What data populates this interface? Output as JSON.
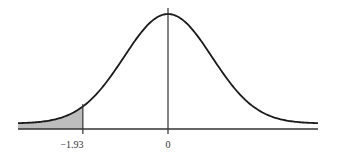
{
  "chart_data": {
    "type": "area",
    "title": "",
    "xlabel": "",
    "ylabel": "",
    "distribution": "standard normal",
    "mean": 0,
    "sd": 1,
    "xlim": [
      -3.4,
      3.4
    ],
    "tick_labels": [
      "-1.93",
      "0"
    ],
    "ticks": [
      -1.93,
      0
    ],
    "shaded_region": {
      "from": -3.4,
      "to": -1.93,
      "tail": "left"
    },
    "grid": false,
    "legend": "none",
    "colors": {
      "curve": "#1a1a1a",
      "axis": "#333333",
      "shade": "#bdbdbd"
    }
  },
  "labels": {
    "tick_neg": "−1.93",
    "tick_zero": "0"
  }
}
